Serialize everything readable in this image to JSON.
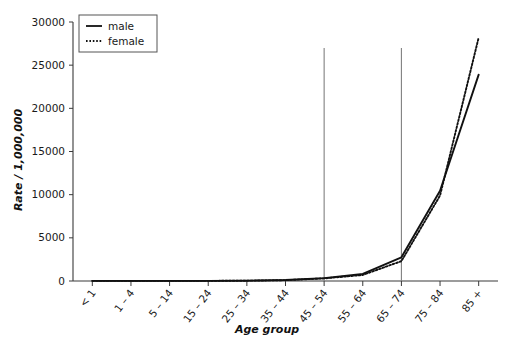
{
  "chart_data": {
    "type": "line",
    "title": "",
    "xlabel": "Age group",
    "ylabel": "Rate / 1,000,000",
    "categories": [
      "< 1",
      "1 – 4",
      "5 – 14",
      "15 – 24",
      "25 – 34",
      "35 – 44",
      "45 – 54",
      "55 – 64",
      "65 – 74",
      "75 – 84",
      "85 +"
    ],
    "series": [
      {
        "name": "male",
        "style": "solid",
        "color": "#111111",
        "values": [
          20,
          10,
          10,
          20,
          40,
          110,
          330,
          830,
          2750,
          10450,
          23900
        ]
      },
      {
        "name": "female",
        "style": "dotted",
        "color": "#111111",
        "values": [
          15,
          10,
          10,
          15,
          35,
          100,
          300,
          700,
          2300,
          9900,
          28200
        ]
      }
    ],
    "ylim": [
      0,
      30000
    ],
    "yticks": [
      0,
      5000,
      10000,
      15000,
      20000,
      25000,
      30000
    ],
    "ytick_labels": [
      "0",
      "5000",
      "10000",
      "15000",
      "20000",
      "25000",
      "30000"
    ],
    "grid": false,
    "legend_position": "top-left",
    "annotations": {
      "reference_lines": [
        {
          "name": "reference-line-45-54",
          "category": "45 – 54",
          "color": "#808080"
        },
        {
          "name": "reference-line-65-74",
          "category": "65 – 74",
          "color": "#808080"
        }
      ]
    }
  },
  "legend": {
    "items": [
      {
        "label": "male",
        "style": "solid"
      },
      {
        "label": "female",
        "style": "dotted"
      }
    ]
  },
  "axes": {
    "y_title": "Rate / 1,000,000",
    "x_title": "Age group"
  }
}
